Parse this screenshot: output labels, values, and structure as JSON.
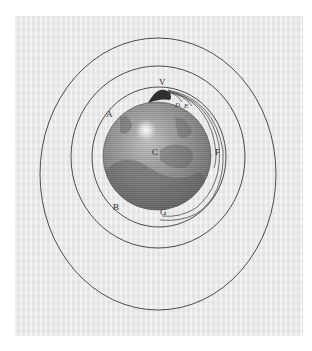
{
  "figure": {
    "colors": {
      "paper": "#ebebeb",
      "ink": "#3a3a3a",
      "globe_light": "#a9a9a9",
      "globe_dark": "#6e6e6e",
      "highlight": "#f4f4f4"
    },
    "labels": {
      "v": "V",
      "a": "A",
      "b": "B",
      "c": "C",
      "d": "D",
      "e": "E",
      "f": "F",
      "g": "G"
    },
    "orbits": [
      {
        "name": "inner",
        "cx": 159,
        "cy": 157,
        "rx": 67,
        "ry": 70
      },
      {
        "name": "middle",
        "cx": 158,
        "cy": 157,
        "rx": 87,
        "ry": 91
      },
      {
        "name": "outer",
        "cx": 158,
        "cy": 174,
        "rx": 118,
        "ry": 136
      }
    ],
    "globe": {
      "cx": 157,
      "cy": 156,
      "r": 54
    },
    "launch_point": {
      "x": 163,
      "y": 92
    }
  }
}
